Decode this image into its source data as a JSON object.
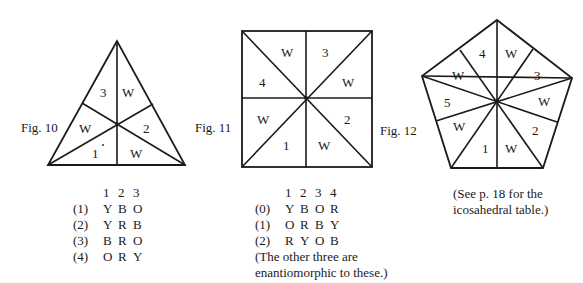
{
  "figures": [
    {
      "caption": "Fig. 10",
      "shape": "triangle",
      "regions": [
        "3",
        "W",
        "2",
        "W",
        "1",
        "W"
      ],
      "table": {
        "headers": [
          "1",
          "2",
          "3"
        ],
        "rows": [
          {
            "index": "(1)",
            "values": [
              "Y",
              "B",
              "O"
            ]
          },
          {
            "index": "(2)",
            "values": [
              "Y",
              "R",
              "B"
            ]
          },
          {
            "index": "(3)",
            "values": [
              "B",
              "R",
              "O"
            ]
          },
          {
            "index": "(4)",
            "values": [
              "O",
              "R",
              "Y"
            ]
          }
        ]
      }
    },
    {
      "caption": "Fig. 11",
      "shape": "square",
      "regions": [
        "W",
        "3",
        "W",
        "2",
        "W",
        "1",
        "W",
        "4"
      ],
      "table": {
        "headers": [
          "1",
          "2",
          "3",
          "4"
        ],
        "rows": [
          {
            "index": "(0)",
            "values": [
              "Y",
              "B",
              "O",
              "R"
            ]
          },
          {
            "index": "(1)",
            "values": [
              "O",
              "R",
              "B",
              "Y"
            ]
          },
          {
            "index": "(2)",
            "values": [
              "R",
              "Y",
              "O",
              "B"
            ]
          }
        ],
        "note_line1": "(The other three are",
        "note_line2": "enantiomorphic to these.)"
      }
    },
    {
      "caption": "Fig. 12",
      "shape": "pentagon",
      "regions": [
        "4",
        "W",
        "3",
        "W",
        "2",
        "W",
        "1",
        "W",
        "5",
        "W"
      ],
      "note_line1": "(See p. 18 for the",
      "note_line2": "icosahedral table.)"
    }
  ]
}
